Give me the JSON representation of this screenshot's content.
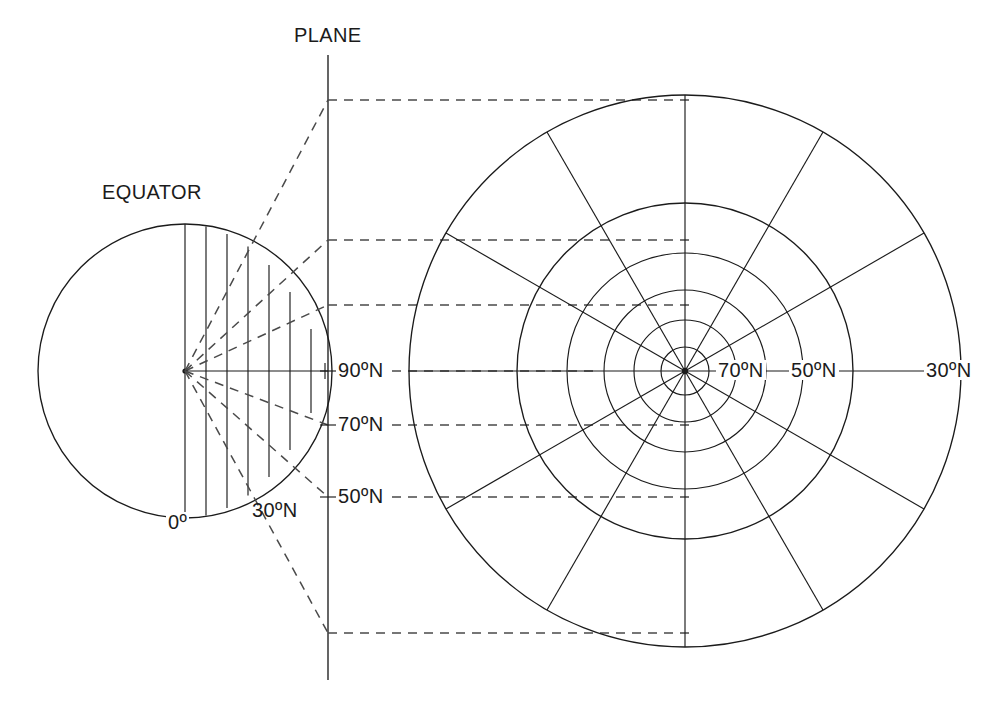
{
  "figure": {
    "kind": "diagram",
    "background_color": "#ffffff",
    "line_color": "#1b1b1b",
    "dashed_line_color": "#4a4a4a"
  },
  "labels": {
    "plane": "PLANE",
    "equator": "EQUATOR",
    "globe_zero": "0º",
    "globe_30n": "30ºN",
    "plane_90n": "90ºN",
    "plane_70n": "70ºN",
    "plane_50n": "50ºN",
    "polar_70n": "70ºN",
    "polar_50n": "50ºN",
    "polar_30n": "30ºN"
  },
  "globe": {
    "center_x": 185,
    "center_y": 371,
    "radius": 147,
    "projection_point_label": "center-of-globe",
    "meridian_offsets": [
      0,
      21,
      42,
      63,
      84,
      105,
      126,
      140
    ],
    "latitude_labels_on_globe": [
      "0º",
      "30ºN"
    ]
  },
  "plane_line": {
    "x": 328,
    "y_top": 55,
    "y_bottom": 680,
    "tick_latitudes": [
      "90ºN",
      "70ºN",
      "50ºN"
    ],
    "tick_y": [
      371,
      425,
      497
    ]
  },
  "projection_rays": {
    "from_x": 185,
    "from_y": 371,
    "targets_y_on_plane": [
      100,
      240,
      305,
      371,
      425,
      497,
      633
    ]
  },
  "dashed_transfer_lines": {
    "from_x": 328,
    "to_x": 685,
    "y_values": [
      100,
      240,
      305,
      371,
      425,
      497,
      633
    ]
  },
  "polar_plot": {
    "center_x": 685,
    "center_y": 371,
    "circle_radii": [
      24,
      51,
      81,
      118,
      168,
      276
    ],
    "circle_latitudes": [
      "90ºN ring",
      "80ºN",
      "70ºN",
      "60ºN",
      "50ºN",
      "30ºN"
    ],
    "meridian_count": 12,
    "meridian_spacing_degrees": 30,
    "axis_labels": [
      "70ºN",
      "50ºN",
      "30ºN"
    ],
    "axis_label_x": [
      718,
      790,
      925
    ],
    "axis_label_y": 371
  }
}
